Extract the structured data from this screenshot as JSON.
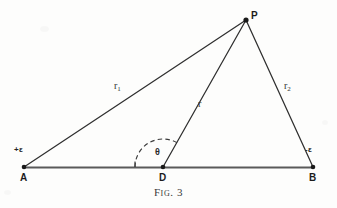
{
  "figure": {
    "caption_prefix": "Fig.",
    "caption_number": "3",
    "background_color": "#fdfdfc",
    "ink_color": "#2b2b2b",
    "baseline_color": "#555555"
  },
  "points": {
    "A": {
      "label": "A",
      "x": 24,
      "y": 167
    },
    "B": {
      "label": "B",
      "x": 313,
      "y": 167
    },
    "D": {
      "label": "D",
      "x": 163,
      "y": 167
    },
    "P": {
      "label": "P",
      "x": 246,
      "y": 20
    }
  },
  "charges": {
    "positive": {
      "label": "+ε",
      "x": 17,
      "y": 150
    },
    "negative": {
      "label": "-ε",
      "x": 306,
      "y": 150
    }
  },
  "segments": {
    "r1": {
      "label": "r",
      "subscript": "1",
      "from": "A",
      "to": "P",
      "label_x": 116,
      "label_y": 86
    },
    "r2": {
      "label": "r",
      "subscript": "2",
      "from": "P",
      "to": "B",
      "label_x": 286,
      "label_y": 86
    },
    "r": {
      "label": "r",
      "subscript": "",
      "from": "D",
      "to": "P",
      "label_x": 199,
      "label_y": 104
    },
    "baseline": {
      "label": "",
      "from": "A",
      "to": "B"
    }
  },
  "angle": {
    "symbol": "θ",
    "label_x": 157,
    "label_y": 152,
    "vertex": "D",
    "arc_radius": 28,
    "arc_style": "dashed"
  }
}
